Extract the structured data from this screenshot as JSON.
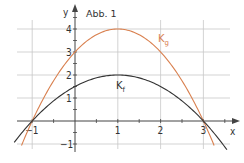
{
  "chart_data": {
    "type": "line",
    "title": "Abb. 1",
    "xlabel": "x",
    "ylabel": "y",
    "xlim": [
      -1.3,
      3.8
    ],
    "ylim": [
      -1.1,
      4.9
    ],
    "x_ticks": [
      -1,
      1,
      2,
      3
    ],
    "x_tick_labels": [
      "-1",
      "1",
      "2",
      "3"
    ],
    "y_ticks": [
      -1,
      1,
      2,
      3,
      4
    ],
    "y_tick_labels": [
      "-1",
      "1",
      "2",
      "3",
      "4"
    ],
    "grid": true,
    "series": [
      {
        "name": "K_g",
        "label_main": "K",
        "label_sub": "g",
        "color": "#d9804f",
        "formula": "g(x) = -(x-1)^2 + 4",
        "x": [
          -1.25,
          -1,
          0,
          1,
          2,
          3,
          3.25
        ],
        "y": [
          -1.06,
          0,
          3,
          4,
          3,
          0,
          -1.06
        ]
      },
      {
        "name": "K_f",
        "label_main": "K",
        "label_sub": "f",
        "color": "#333333",
        "formula": "f(x) = -0.5(x-1)^2 + 2",
        "x": [
          -1.4,
          -1,
          0,
          1,
          2,
          3,
          3.5
        ],
        "y": [
          -0.88,
          0,
          1.5,
          2,
          1.5,
          0,
          -1.13
        ]
      }
    ]
  },
  "colors": {
    "grid": "#c8c8c8",
    "axis": "#444444",
    "g_curve": "#d9804f",
    "f_curve": "#333333"
  }
}
